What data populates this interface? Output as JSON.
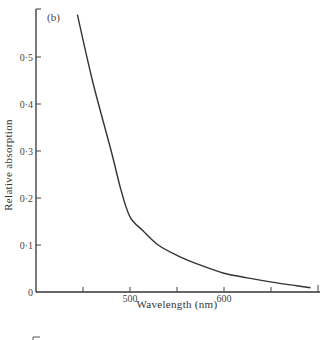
{
  "chart_data": {
    "type": "line",
    "title": "",
    "panel_label": "(b)",
    "xlabel": "Wavelength (nm)",
    "ylabel": "Relative absorption",
    "xlim": [
      400,
      700
    ],
    "ylim": [
      0,
      0.6
    ],
    "grid": false,
    "legend": null,
    "x_ticks": [
      450,
      500,
      550,
      600,
      650,
      700
    ],
    "x_tick_labels": [
      {
        "value": 500,
        "label": "500"
      },
      {
        "value": 600,
        "label": "600"
      }
    ],
    "y_ticks": [
      0,
      0.1,
      0.2,
      0.3,
      0.4,
      0.5,
      0.6
    ],
    "y_tick_labels": [
      {
        "value": 0,
        "label": "0"
      },
      {
        "value": 0.1,
        "label": "0·1"
      },
      {
        "value": 0.2,
        "label": "0·2"
      },
      {
        "value": 0.3,
        "label": "0·3"
      },
      {
        "value": 0.4,
        "label": "0·4"
      },
      {
        "value": 0.5,
        "label": "0·5"
      }
    ],
    "series": [
      {
        "name": "absorption",
        "x": [
          444,
          460,
          480,
          490,
          500,
          514,
          530,
          551,
          575,
          600,
          625,
          651,
          675,
          692
        ],
        "y": [
          0.59,
          0.45,
          0.3,
          0.22,
          0.16,
          0.13,
          0.1,
          0.077,
          0.057,
          0.04,
          0.03,
          0.021,
          0.014,
          0.009
        ]
      }
    ]
  }
}
